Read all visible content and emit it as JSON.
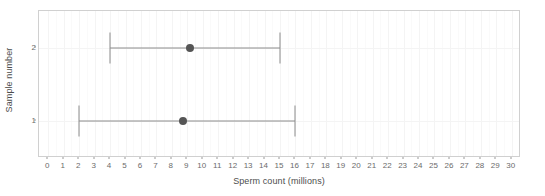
{
  "chart_data": {
    "type": "scatter",
    "title": "",
    "xlabel": "Sperm count (millions)",
    "ylabel": "Sample number",
    "xlim": [
      -0.6,
      30.6
    ],
    "ylim": [
      0.5,
      2.5
    ],
    "grid": true,
    "legend": null,
    "x_ticks": [
      0,
      1,
      2,
      3,
      4,
      5,
      6,
      7,
      8,
      9,
      10,
      11,
      12,
      13,
      14,
      15,
      16,
      17,
      18,
      19,
      20,
      21,
      22,
      23,
      24,
      25,
      26,
      27,
      28,
      29,
      30
    ],
    "x_tick_labels": [
      "0",
      "1",
      "2",
      "3",
      "4",
      "5",
      "6",
      "7",
      "8",
      "9",
      "10",
      "11",
      "12",
      "13",
      "14",
      "15",
      "16",
      "17",
      "18",
      "19",
      "20",
      "21",
      "22",
      "23",
      "24",
      "25",
      "26",
      "27",
      "28",
      "29",
      "30"
    ],
    "y_ticks": [
      1,
      2
    ],
    "y_tick_labels": [
      "1",
      "2"
    ],
    "series": [
      {
        "name": "Sample 2",
        "category": "2",
        "y": 2,
        "value": 9.2,
        "lower": 4.0,
        "upper": 15.0
      },
      {
        "name": "Sample 1",
        "category": "1",
        "y": 1,
        "value": 8.7,
        "lower": 2.0,
        "upper": 16.0
      }
    ],
    "colors": {
      "point": "#555555",
      "errorbar": "#8c8c8c",
      "panel_background": "#ffffff",
      "panel_border": "#d0d0d0",
      "gridline_major": "#f4f4f4",
      "gridline_minor": "#fafafa",
      "tick_label": "#6b6b6b",
      "axis_title": "#4d4d4d"
    }
  }
}
